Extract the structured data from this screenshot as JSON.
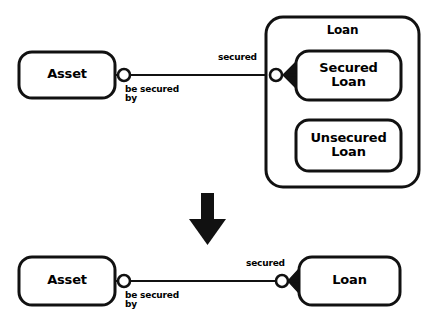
{
  "diagram": {
    "stroke_color": "#111111",
    "fill_color": "#ffffff",
    "top": {
      "entities": [
        {
          "id": "asset",
          "label": "Asset"
        },
        {
          "id": "loan-group",
          "label": "Loan"
        },
        {
          "id": "secured-loan",
          "label": "Secured\nLoan"
        },
        {
          "id": "unsecured-loan",
          "label": "Unsecured\nLoan"
        }
      ],
      "relationship": {
        "forward_label": "secured",
        "reverse_label": "be secured\nby",
        "left_cardinality": "zero-or-one",
        "right_cardinality": "zero-or-many"
      }
    },
    "transform_arrow": {
      "direction": "down"
    },
    "bottom": {
      "entities": [
        {
          "id": "asset",
          "label": "Asset"
        },
        {
          "id": "loan",
          "label": "Loan"
        }
      ],
      "relationship": {
        "forward_label": "secured",
        "reverse_label": "be secured\nby",
        "left_cardinality": "zero-or-one",
        "right_cardinality": "zero-or-many"
      }
    }
  }
}
